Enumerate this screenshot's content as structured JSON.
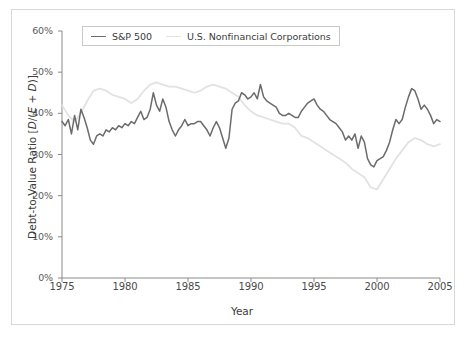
{
  "figure": {
    "ylabel_prefix": "Debt-to-Value Ratio [",
    "ylabel_italic_d": "D",
    "ylabel_mid": "/(",
    "ylabel_italic_e": "E",
    "ylabel_plus": " + ",
    "ylabel_italic_d2": "D",
    "ylabel_suffix": ")]",
    "ylabel_full": "Debt-to-Value Ratio [D/(E + D)]",
    "xlabel": "Year",
    "background_color": "#ffffff",
    "frame_color": "#d8d8d8",
    "axis_color": "#8a8a8a"
  },
  "legend": {
    "position": "upper-left-inside",
    "entries": [
      {
        "label": "S&P 500",
        "color": "#6b6b6b"
      },
      {
        "label": "U.S. Nonfinancial Corporations",
        "color": "#e2e2e2"
      }
    ]
  },
  "chart_data": {
    "type": "line",
    "title": "",
    "subtitle": "",
    "xlabel": "Year",
    "ylabel": "Debt-to-Value Ratio [D/(E + D)]",
    "xlim": [
      1975,
      2005
    ],
    "ylim": [
      0,
      60
    ],
    "yunit": "%",
    "grid": false,
    "legend_position": "upper left",
    "xticks": [
      1975,
      1980,
      1985,
      1990,
      1995,
      2000,
      2005
    ],
    "xtick_labels": [
      "1975",
      "1980",
      "1985",
      "1990",
      "1995",
      "2000",
      "2005"
    ],
    "yticks": [
      0,
      10,
      20,
      30,
      40,
      50,
      60
    ],
    "ytick_labels": [
      "0%",
      "10%",
      "20%",
      "30%",
      "40%",
      "50%",
      "60%"
    ],
    "series": [
      {
        "name": "S&P 500",
        "color": "#6b6b6b",
        "linewidth": 1.5,
        "x": [
          1975.0,
          1975.25,
          1975.5,
          1975.75,
          1976.0,
          1976.25,
          1976.5,
          1976.75,
          1977.0,
          1977.25,
          1977.5,
          1977.75,
          1978.0,
          1978.25,
          1978.5,
          1978.75,
          1979.0,
          1979.25,
          1979.5,
          1979.75,
          1980.0,
          1980.25,
          1980.5,
          1980.75,
          1981.0,
          1981.25,
          1981.5,
          1981.75,
          1982.0,
          1982.25,
          1982.5,
          1982.75,
          1983.0,
          1983.25,
          1983.5,
          1983.75,
          1984.0,
          1984.25,
          1984.5,
          1984.75,
          1985.0,
          1985.25,
          1985.5,
          1985.75,
          1986.0,
          1986.25,
          1986.5,
          1986.75,
          1987.0,
          1987.25,
          1987.5,
          1987.75,
          1988.0,
          1988.25,
          1988.5,
          1988.75,
          1989.0,
          1989.25,
          1989.5,
          1989.75,
          1990.0,
          1990.25,
          1990.5,
          1990.75,
          1991.0,
          1991.25,
          1991.5,
          1991.75,
          1992.0,
          1992.25,
          1992.5,
          1992.75,
          1993.0,
          1993.25,
          1993.5,
          1993.75,
          1994.0,
          1994.25,
          1994.5,
          1994.75,
          1995.0,
          1995.25,
          1995.5,
          1995.75,
          1996.0,
          1996.25,
          1996.5,
          1996.75,
          1997.0,
          1997.25,
          1997.5,
          1997.75,
          1998.0,
          1998.25,
          1998.5,
          1998.75,
          1999.0,
          1999.25,
          1999.5,
          1999.75,
          2000.0,
          2000.25,
          2000.5,
          2000.75,
          2001.0,
          2001.25,
          2001.5,
          2001.75,
          2002.0,
          2002.25,
          2002.5,
          2002.75,
          2003.0,
          2003.25,
          2003.5,
          2003.75,
          2004.0,
          2004.25,
          2004.5,
          2004.75,
          2005.0
        ],
        "y": [
          38.0,
          37.0,
          38.5,
          35.0,
          39.5,
          36.0,
          41.0,
          39.0,
          36.5,
          33.5,
          32.5,
          34.5,
          35.0,
          34.5,
          36.0,
          35.5,
          36.5,
          36.0,
          37.0,
          36.5,
          37.5,
          37.0,
          38.0,
          37.5,
          39.0,
          40.5,
          38.5,
          39.0,
          41.0,
          45.0,
          42.0,
          40.5,
          43.5,
          41.5,
          38.0,
          36.0,
          34.5,
          36.0,
          37.0,
          38.5,
          37.0,
          37.5,
          37.5,
          38.0,
          38.0,
          37.0,
          36.0,
          34.5,
          36.5,
          38.0,
          36.5,
          34.0,
          31.5,
          34.0,
          41.0,
          42.5,
          43.0,
          45.0,
          44.5,
          43.5,
          44.0,
          45.0,
          43.5,
          47.0,
          44.0,
          43.0,
          42.5,
          42.0,
          41.5,
          40.0,
          39.5,
          39.5,
          40.0,
          39.5,
          39.0,
          39.0,
          40.5,
          41.5,
          42.5,
          43.0,
          43.5,
          42.0,
          41.0,
          40.5,
          39.5,
          38.5,
          38.0,
          37.5,
          36.5,
          35.5,
          33.5,
          34.5,
          33.5,
          35.0,
          31.5,
          34.5,
          33.0,
          29.0,
          27.5,
          27.0,
          28.5,
          29.0,
          29.5,
          31.0,
          33.0,
          36.0,
          38.5,
          37.5,
          38.5,
          41.5,
          44.0,
          46.0,
          45.5,
          43.5,
          41.0,
          42.0,
          41.0,
          39.5,
          37.5,
          38.5,
          38.0
        ]
      },
      {
        "name": "U.S. Nonfinancial Corporations",
        "color": "#e2e2e2",
        "linewidth": 1.8,
        "x": [
          1975.0,
          1975.5,
          1976.0,
          1976.5,
          1977.0,
          1977.5,
          1978.0,
          1978.5,
          1979.0,
          1979.5,
          1980.0,
          1980.5,
          1981.0,
          1981.5,
          1982.0,
          1982.5,
          1983.0,
          1983.5,
          1984.0,
          1984.5,
          1985.0,
          1985.5,
          1986.0,
          1986.5,
          1987.0,
          1987.5,
          1988.0,
          1988.5,
          1989.0,
          1989.5,
          1990.0,
          1990.5,
          1991.0,
          1991.5,
          1992.0,
          1992.5,
          1993.0,
          1993.5,
          1994.0,
          1994.5,
          1995.0,
          1995.5,
          1996.0,
          1996.5,
          1997.0,
          1997.5,
          1998.0,
          1998.5,
          1999.0,
          1999.5,
          2000.0,
          2000.5,
          2001.0,
          2001.5,
          2002.0,
          2002.5,
          2003.0,
          2003.5,
          2004.0,
          2004.5,
          2005.0
        ],
        "y": [
          42.0,
          39.5,
          38.0,
          40.0,
          43.0,
          45.5,
          46.0,
          45.5,
          44.5,
          44.0,
          43.5,
          42.5,
          43.5,
          45.5,
          47.0,
          47.5,
          47.0,
          46.5,
          46.5,
          46.0,
          45.5,
          45.0,
          45.5,
          46.5,
          47.0,
          46.5,
          46.0,
          45.0,
          44.0,
          42.0,
          40.5,
          39.5,
          39.0,
          38.5,
          38.0,
          37.5,
          37.5,
          36.5,
          34.5,
          34.0,
          33.0,
          32.0,
          31.0,
          30.0,
          29.0,
          28.0,
          26.5,
          25.5,
          24.5,
          22.0,
          21.5,
          24.0,
          26.5,
          29.0,
          31.0,
          33.0,
          34.0,
          33.5,
          32.5,
          32.0,
          32.5
        ]
      }
    ]
  }
}
